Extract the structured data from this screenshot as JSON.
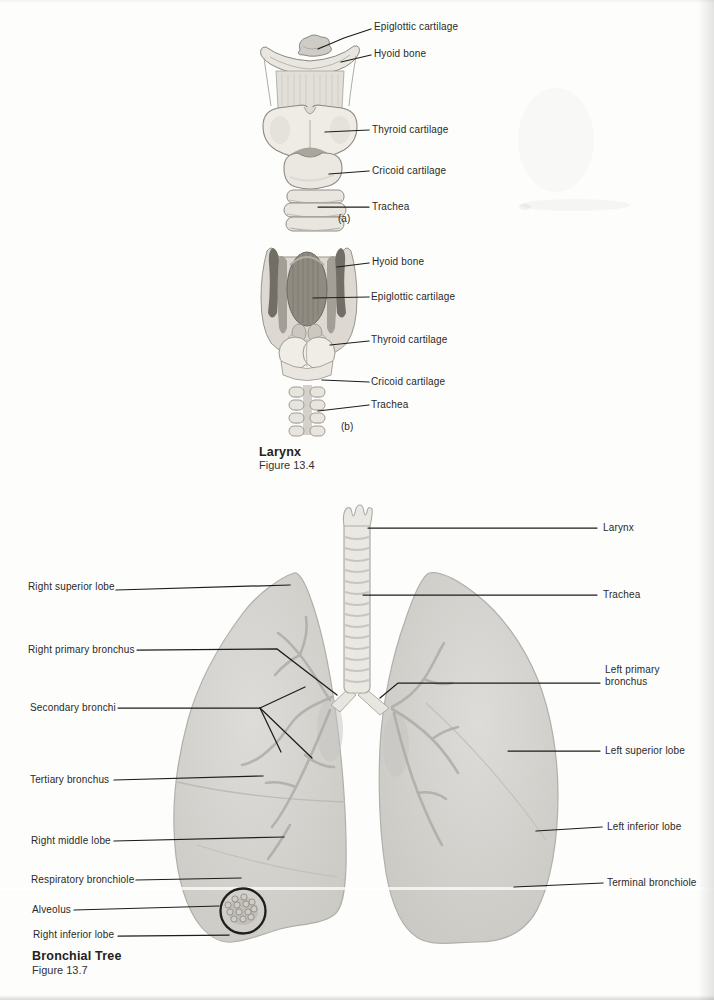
{
  "figures": {
    "larynx": {
      "caption_title": "Larynx",
      "caption_figure": "Figure 13.4",
      "panel_a": {
        "tag": "(a)",
        "labels": {
          "epiglottic": "Epiglottic cartilage",
          "hyoid": "Hyoid bone",
          "thyroid": "Thyroid cartilage",
          "cricoid": "Cricoid cartilage",
          "trachea": "Trachea"
        }
      },
      "panel_b": {
        "tag": "(b)",
        "labels": {
          "hyoid": "Hyoid bone",
          "epiglottic": "Epiglottic cartilage",
          "thyroid": "Thyroid cartilage",
          "cricoid": "Cricoid cartilage",
          "trachea": "Trachea"
        }
      }
    },
    "bronchial_tree": {
      "caption_title": "Bronchial Tree",
      "caption_figure": "Figure 13.7",
      "left_labels": {
        "right_superior_lobe": "Right superior lobe",
        "right_primary_bronchus": "Right primary bronchus",
        "secondary_bronchi": "Secondary bronchi",
        "tertiary_bronchus": "Tertiary bronchus",
        "right_middle_lobe": "Right middle lobe",
        "respiratory_bronchiole": "Respiratory bronchiole",
        "alveolus": "Alveolus",
        "right_inferior_lobe": "Right inferior lobe"
      },
      "right_labels": {
        "larynx": "Larynx",
        "trachea": "Trachea",
        "left_primary_bronchus": "Left primary bronchus",
        "left_superior_lobe": "Left superior lobe",
        "left_inferior_lobe": "Left inferior lobe",
        "terminal_bronchiole": "Terminal bronchiole"
      }
    }
  },
  "colors": {
    "ink": "#1d1d1b",
    "paper": "#fdfdfc",
    "illustration_light": "#ebe8e1",
    "illustration_dark": "#716e66",
    "lung_gray": "#d8d6d2"
  }
}
